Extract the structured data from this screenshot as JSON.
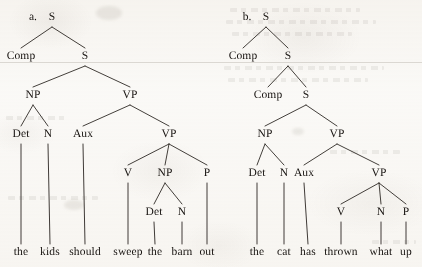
{
  "page": {
    "kind": "linguistics-syntax-tree-figure",
    "background_color": "#fbfaf8",
    "ink_color": "#16120f",
    "width": 422,
    "height": 267
  },
  "figures": [
    {
      "id": "a",
      "item_label": "a.",
      "item_label_pos": {
        "x": 33,
        "y": 18
      },
      "sentence": "the kids should sweep the barn out",
      "nodes": [
        {
          "id": "a-S1",
          "label": "S",
          "x": 52,
          "y": 18
        },
        {
          "id": "a-Comp",
          "label": "Comp",
          "x": 21,
          "y": 57
        },
        {
          "id": "a-S2",
          "label": "S",
          "x": 85,
          "y": 57
        },
        {
          "id": "a-NP1",
          "label": "NP",
          "x": 33,
          "y": 96
        },
        {
          "id": "a-VP1",
          "label": "VP",
          "x": 130,
          "y": 96
        },
        {
          "id": "a-Det1",
          "label": "Det",
          "x": 21,
          "y": 135
        },
        {
          "id": "a-N1",
          "label": "N",
          "x": 48,
          "y": 135
        },
        {
          "id": "a-Aux",
          "label": "Aux",
          "x": 83,
          "y": 135
        },
        {
          "id": "a-VP2",
          "label": "VP",
          "x": 169,
          "y": 135
        },
        {
          "id": "a-V",
          "label": "V",
          "x": 128,
          "y": 174
        },
        {
          "id": "a-NP2",
          "label": "NP",
          "x": 165,
          "y": 174
        },
        {
          "id": "a-P",
          "label": "P",
          "x": 207,
          "y": 174
        },
        {
          "id": "a-Det2",
          "label": "Det",
          "x": 154,
          "y": 213
        },
        {
          "id": "a-N2",
          "label": "N",
          "x": 182,
          "y": 213
        }
      ],
      "edges": [
        {
          "from": "a-S1",
          "to": "a-Comp"
        },
        {
          "from": "a-S1",
          "to": "a-S2"
        },
        {
          "from": "a-S2",
          "to": "a-NP1"
        },
        {
          "from": "a-S2",
          "to": "a-VP1"
        },
        {
          "from": "a-NP1",
          "to": "a-Det1"
        },
        {
          "from": "a-NP1",
          "to": "a-N1"
        },
        {
          "from": "a-VP1",
          "to": "a-Aux"
        },
        {
          "from": "a-VP1",
          "to": "a-VP2"
        },
        {
          "from": "a-VP2",
          "to": "a-V"
        },
        {
          "from": "a-VP2",
          "to": "a-NP2"
        },
        {
          "from": "a-VP2",
          "to": "a-P"
        },
        {
          "from": "a-NP2",
          "to": "a-Det2"
        },
        {
          "from": "a-NP2",
          "to": "a-N2"
        }
      ],
      "leaves": [
        {
          "id": "a-w1",
          "word": "the",
          "x": 21,
          "y": 253,
          "from": "a-Det1"
        },
        {
          "id": "a-w2",
          "word": "kids",
          "x": 50,
          "y": 253,
          "from": "a-N1"
        },
        {
          "id": "a-w3",
          "word": "should",
          "x": 85,
          "y": 253,
          "from": "a-Aux"
        },
        {
          "id": "a-w4",
          "word": "sweep",
          "x": 128,
          "y": 253,
          "from": "a-V"
        },
        {
          "id": "a-w5",
          "word": "the",
          "x": 155,
          "y": 253,
          "from": "a-Det2"
        },
        {
          "id": "a-w6",
          "word": "barn",
          "x": 182,
          "y": 253,
          "from": "a-N2"
        },
        {
          "id": "a-w7",
          "word": "out",
          "x": 207,
          "y": 253,
          "from": "a-P"
        }
      ]
    },
    {
      "id": "b",
      "item_label": "b.",
      "item_label_pos": {
        "x": 247,
        "y": 18
      },
      "sentence": "the cat has thrown what up",
      "nodes": [
        {
          "id": "b-S1",
          "label": "S",
          "x": 266,
          "y": 18
        },
        {
          "id": "b-Comp1",
          "label": "Comp",
          "x": 243,
          "y": 57
        },
        {
          "id": "b-S2",
          "label": "S",
          "x": 288,
          "y": 57
        },
        {
          "id": "b-Comp2",
          "label": "Comp",
          "x": 268,
          "y": 96
        },
        {
          "id": "b-S3",
          "label": "S",
          "x": 306,
          "y": 96
        },
        {
          "id": "b-NP",
          "label": "NP",
          "x": 265,
          "y": 135
        },
        {
          "id": "b-VP1",
          "label": "VP",
          "x": 337,
          "y": 135
        },
        {
          "id": "b-Det",
          "label": "Det",
          "x": 257,
          "y": 174
        },
        {
          "id": "b-N1",
          "label": "N",
          "x": 284,
          "y": 174
        },
        {
          "id": "b-Aux",
          "label": "Aux",
          "x": 304,
          "y": 174
        },
        {
          "id": "b-VP2",
          "label": "VP",
          "x": 379,
          "y": 174
        },
        {
          "id": "b-V",
          "label": "V",
          "x": 341,
          "y": 213
        },
        {
          "id": "b-N2",
          "label": "N",
          "x": 381,
          "y": 213
        },
        {
          "id": "b-P",
          "label": "P",
          "x": 406,
          "y": 213
        }
      ],
      "edges": [
        {
          "from": "b-S1",
          "to": "b-Comp1"
        },
        {
          "from": "b-S1",
          "to": "b-S2"
        },
        {
          "from": "b-S2",
          "to": "b-Comp2"
        },
        {
          "from": "b-S2",
          "to": "b-S3"
        },
        {
          "from": "b-S3",
          "to": "b-NP"
        },
        {
          "from": "b-S3",
          "to": "b-VP1"
        },
        {
          "from": "b-NP",
          "to": "b-Det"
        },
        {
          "from": "b-NP",
          "to": "b-N1"
        },
        {
          "from": "b-VP1",
          "to": "b-Aux"
        },
        {
          "from": "b-VP1",
          "to": "b-VP2"
        },
        {
          "from": "b-VP2",
          "to": "b-V"
        },
        {
          "from": "b-VP2",
          "to": "b-N2"
        },
        {
          "from": "b-VP2",
          "to": "b-P"
        }
      ],
      "leaves": [
        {
          "id": "b-w1",
          "word": "the",
          "x": 257,
          "y": 253,
          "from": "b-Det"
        },
        {
          "id": "b-w2",
          "word": "cat",
          "x": 284,
          "y": 253,
          "from": "b-N1"
        },
        {
          "id": "b-w3",
          "word": "has",
          "x": 308,
          "y": 253,
          "from": "b-Aux"
        },
        {
          "id": "b-w4",
          "word": "thrown",
          "x": 341,
          "y": 253,
          "from": "b-V"
        },
        {
          "id": "b-w5",
          "word": "what",
          "x": 381,
          "y": 253,
          "from": "b-N2"
        },
        {
          "id": "b-w6",
          "word": "up",
          "x": 406,
          "y": 253,
          "from": "b-P"
        }
      ]
    }
  ]
}
